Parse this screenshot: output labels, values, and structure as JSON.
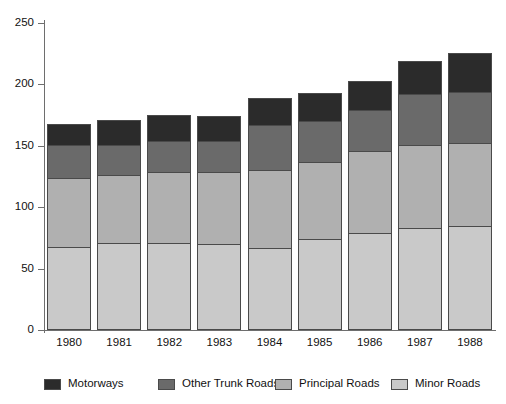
{
  "chart_data": {
    "type": "bar",
    "subtype": "stacked-bar",
    "title": "",
    "xlabel": "",
    "ylabel": "",
    "categories": [
      "1980",
      "1981",
      "1982",
      "1983",
      "1984",
      "1985",
      "1986",
      "1987",
      "1988"
    ],
    "ylim": [
      0,
      250
    ],
    "yticks": [
      0,
      50,
      100,
      150,
      200,
      250
    ],
    "ytick_labels": [
      "0",
      "50",
      "100",
      "150",
      "200",
      "250"
    ],
    "grid": false,
    "legend_position": "bottom",
    "stack_order_bottom_to_top": [
      "Minor Roads",
      "Principal Roads",
      "Other Trunk Roads",
      "Motorways"
    ],
    "series": [
      {
        "name": "Motorways",
        "color": "#2b2b2b",
        "values": [
          17,
          20,
          21,
          20,
          22,
          23,
          24,
          27,
          32
        ]
      },
      {
        "name": "Other Trunk Roads",
        "color": "#6a6a6a",
        "values": [
          27,
          25,
          25,
          25,
          37,
          33,
          33,
          41,
          42
        ]
      },
      {
        "name": "Principal Roads",
        "color": "#b0b0b0",
        "values": [
          56,
          55,
          58,
          59,
          63,
          63,
          67,
          68,
          67
        ]
      },
      {
        "name": "Minor Roads",
        "color": "#c9c9c9",
        "values": [
          68,
          71,
          71,
          70,
          67,
          74,
          79,
          83,
          85
        ]
      }
    ],
    "totals": [
      168,
      171,
      175,
      174,
      189,
      193,
      203,
      219,
      226
    ]
  },
  "legend": {
    "items": [
      {
        "label": "Motorways",
        "color": "#2b2b2b"
      },
      {
        "label": "Other Trunk Roads",
        "color": "#6a6a6a"
      },
      {
        "label": "Principal Roads",
        "color": "#b0b0b0"
      },
      {
        "label": "Minor Roads",
        "color": "#c9c9c9"
      }
    ]
  },
  "axes": {
    "y_tick_labels": [
      "250",
      "200",
      "150",
      "100",
      "50",
      "0"
    ],
    "x_tick_labels": [
      "1980",
      "1981",
      "1982",
      "1983",
      "1984",
      "1985",
      "1986",
      "1987",
      "1988"
    ]
  }
}
